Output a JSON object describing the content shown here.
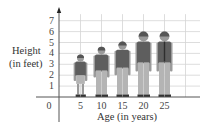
{
  "chart_data": {
    "type": "bar",
    "style": "pictograph",
    "title": "",
    "xlabel": "Age (in years)",
    "ylabel_lines": [
      "Height",
      "(in feet)"
    ],
    "categories": [
      "5",
      "10",
      "15",
      "20",
      "25"
    ],
    "x": [
      5,
      10,
      15,
      20,
      25
    ],
    "values": [
      3.9,
      4.6,
      5.1,
      6.0,
      6.0
    ],
    "y_ticks": [
      "1",
      "2",
      "3",
      "4",
      "5",
      "6",
      "7"
    ],
    "origin_label": "0",
    "ylim": [
      0,
      7.5
    ],
    "xlim": [
      0,
      30
    ],
    "grid": true,
    "legend": null,
    "colors": {
      "grid": "#d4d4d4",
      "axis": "#555555",
      "shirt": "#5e5e5e",
      "pants": "#b4b4b4",
      "skin": "#9a9a9a",
      "hair": "#555555",
      "shoes": "#333333"
    }
  }
}
